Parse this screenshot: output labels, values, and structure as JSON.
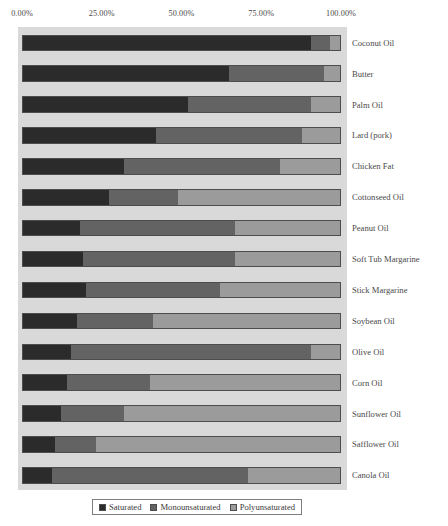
{
  "chart_data": {
    "type": "bar",
    "subtype": "horizontal-stacked-100",
    "title": "",
    "subtitle": "",
    "xlabel": "",
    "ylabel": "",
    "xlim": [
      0,
      100
    ],
    "grid": false,
    "legend_position": "bottom",
    "axis_ticks": [
      "0.00%",
      "25.00%",
      "50.00%",
      "75.00%",
      "100.00%"
    ],
    "axis_tick_values": [
      0,
      25,
      50,
      75,
      100
    ],
    "categories": [
      "Coconut Oil",
      "Butter",
      "Palm Oil",
      "Lard (pork)",
      "Chicken Fat",
      "Cottonseed Oil",
      "Peanut Oil",
      "Soft Tub Margarine",
      "Stick Margarine",
      "Soybean Oil",
      "Olive Oil",
      "Corn Oil",
      "Sunflower Oil",
      "Safflower Oil",
      "Canola Oil"
    ],
    "series": [
      {
        "name": "Saturated",
        "color": "#2b2b2b",
        "values": [
          91,
          65,
          52,
          42,
          32,
          27,
          18,
          19,
          20,
          17,
          15,
          14,
          12,
          10,
          9
        ]
      },
      {
        "name": "Monounsaturated",
        "color": "#636363",
        "values": [
          6,
          30,
          39,
          46,
          49,
          22,
          49,
          48,
          42,
          24,
          76,
          26,
          20,
          13,
          62
        ]
      },
      {
        "name": "Polyunsaturated",
        "color": "#9b9b9b",
        "values": [
          3,
          5,
          9,
          12,
          19,
          51,
          33,
          33,
          38,
          59,
          9,
          60,
          68,
          77,
          29
        ]
      }
    ],
    "legend": [
      {
        "label": "Saturated",
        "swatch": "#2b2b2b"
      },
      {
        "label": "Monounsaturated",
        "swatch": "#636363"
      },
      {
        "label": "Polyunsaturated",
        "swatch": "#9b9b9b"
      }
    ]
  }
}
